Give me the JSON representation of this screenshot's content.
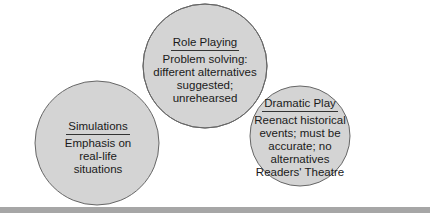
{
  "diagram": {
    "type": "venn",
    "colors": {
      "circle_fill": "#d4d4d4",
      "overlap_fill": "#b0b0b0",
      "stroke": "#666666",
      "bar": "#a6a6a6"
    },
    "circles": [
      {
        "id": "role-playing",
        "title": "Role Playing",
        "description": "Problem solving: different alternatives suggested; unrehearsed"
      },
      {
        "id": "simulations",
        "title": "Simulations",
        "description": "Emphasis on real-life situations"
      },
      {
        "id": "dramatic-play",
        "title": "Dramatic Play",
        "description": "Reenact historical events; must be accurate; no alternatives Readers' Theatre"
      }
    ]
  }
}
